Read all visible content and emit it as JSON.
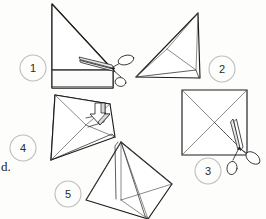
{
  "page": {
    "background_color": "#fdfdfc",
    "ink_color": "#1c1c1c",
    "circle_color": "#bdbdbd",
    "margin_text": "d."
  },
  "steps": [
    {
      "number": "1",
      "name": "step-1",
      "shape": "right triangle with folded bottom band",
      "tool": "scissors",
      "circle": {
        "cx": 33,
        "cy": 68,
        "r": 13
      },
      "label_pos": {
        "x": 33,
        "y": 68
      }
    },
    {
      "number": "2",
      "name": "step-2",
      "shape": "triangle folded with inner crease lines",
      "tool": "none",
      "circle": {
        "cx": 222,
        "cy": 69,
        "r": 13
      },
      "label_pos": {
        "x": 222,
        "y": 69
      }
    },
    {
      "number": "3",
      "name": "step-3",
      "shape": "square with two diagonals, one dashed cut line",
      "tool": "scissors",
      "circle": {
        "cx": 208,
        "cy": 171,
        "r": 13
      },
      "label_pos": {
        "x": 208,
        "y": 171
      }
    },
    {
      "number": "4",
      "name": "step-4",
      "shape": "folded triangular form with downward push arrow",
      "tool": "arrow",
      "circle": {
        "cx": 23,
        "cy": 148,
        "r": 13
      },
      "label_pos": {
        "x": 23,
        "y": 148
      }
    },
    {
      "number": "5",
      "name": "step-5",
      "shape": "finished four-pointed folded star form",
      "tool": "none",
      "circle": {
        "cx": 68,
        "cy": 194,
        "r": 13
      },
      "label_pos": {
        "x": 68,
        "y": 194
      }
    }
  ]
}
